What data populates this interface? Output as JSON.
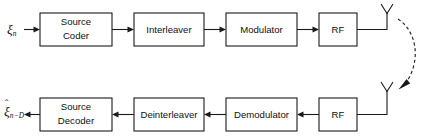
{
  "diagram": {
    "stroke_color": "#1a1a1a",
    "background_color": "#ffffff",
    "width": 427,
    "height": 139,
    "transmitter_chain": {
      "input_signal": {
        "glyph": "ξ",
        "subscript": "n",
        "has_hat": false
      },
      "blocks": [
        {
          "id": "source-coder",
          "label_line1": "Source",
          "label_line2": "Coder",
          "x": 40,
          "y": 13,
          "w": 72,
          "h": 33
        },
        {
          "id": "interleaver",
          "label_line1": "Interleaver",
          "label_line2": "",
          "x": 134,
          "y": 13,
          "w": 70,
          "h": 33
        },
        {
          "id": "modulator",
          "label_line1": "Modulator",
          "label_line2": "",
          "x": 226,
          "y": 13,
          "w": 71,
          "h": 33
        },
        {
          "id": "rf-transmit",
          "label_line1": "RF",
          "label_line2": "",
          "x": 319,
          "y": 13,
          "w": 38,
          "h": 33
        }
      ],
      "antenna": {
        "id": "transmit-antenna",
        "x": 387,
        "y_top": 4,
        "y_bottom": 30
      }
    },
    "receiver_chain": {
      "output_signal": {
        "glyph": "ξ",
        "subscript": "n−D",
        "has_hat": true,
        "hat": "ˆ"
      },
      "blocks": [
        {
          "id": "source-decoder",
          "label_line1": "Source",
          "label_line2": "Decoder",
          "x": 40,
          "y": 98,
          "w": 72,
          "h": 33
        },
        {
          "id": "deinterleaver",
          "label_line1": "Deinterleaver",
          "label_line2": "",
          "x": 134,
          "y": 98,
          "w": 70,
          "h": 33
        },
        {
          "id": "demodulator",
          "label_line1": "Demodulator",
          "label_line2": "",
          "x": 226,
          "y": 98,
          "w": 71,
          "h": 33
        },
        {
          "id": "rf-receive",
          "label_line1": "RF",
          "label_line2": "",
          "x": 319,
          "y": 98,
          "w": 38,
          "h": 33
        }
      ],
      "antenna": {
        "id": "receive-antenna",
        "x": 387,
        "y_top": 82,
        "y_bottom": 114
      }
    },
    "radio_link": {
      "id": "wireless-propagation-arc",
      "style": "dashed-curved-arrow",
      "direction": "transmit-antenna-to-receive-antenna"
    }
  }
}
